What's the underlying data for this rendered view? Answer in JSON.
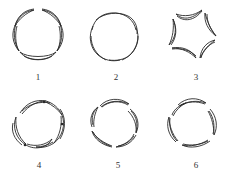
{
  "figures": [
    {
      "id": "1",
      "label": "1",
      "type": "outward-crescents-gap-top"
    },
    {
      "id": "2",
      "label": "2",
      "type": "overlapping-lobes"
    },
    {
      "id": "3",
      "label": "3",
      "type": "concave-star"
    },
    {
      "id": "4",
      "label": "4",
      "type": "pinwheel-with-dots"
    },
    {
      "id": "5",
      "label": "5",
      "type": "pinwheel"
    },
    {
      "id": "6",
      "label": "6",
      "type": "pinwheel-spaced"
    }
  ],
  "colors": {
    "stroke": "#2a2a2a",
    "background": "#ffffff",
    "label": "#333333"
  }
}
